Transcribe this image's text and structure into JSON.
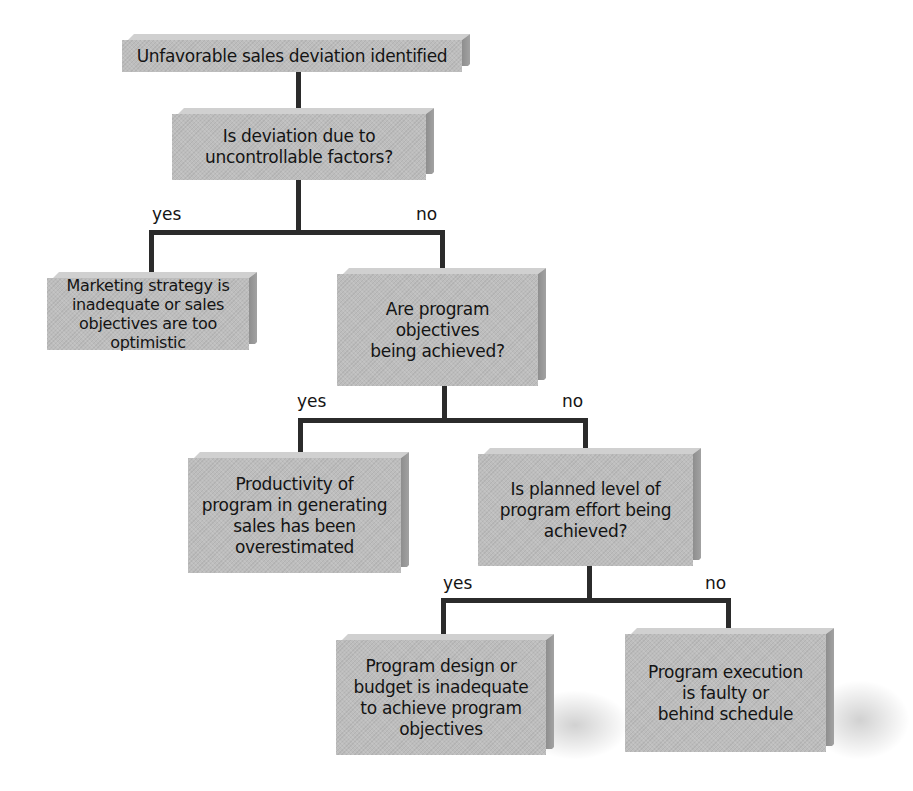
{
  "diagram": {
    "type": "decision-tree",
    "nodes": [
      {
        "id": "start",
        "text": "Unfavorable sales deviation identified"
      },
      {
        "id": "q1",
        "text": "Is deviation due to\nuncontrollable factors?"
      },
      {
        "id": "r1",
        "text": "Marketing strategy is\ninadequate or sales\nobjectives are too\noptimistic"
      },
      {
        "id": "q2",
        "text": "Are program\nobjectives\nbeing achieved?"
      },
      {
        "id": "r2",
        "text": "Productivity of\nprogram in generating\nsales has been\noverestimated"
      },
      {
        "id": "q3",
        "text": "Is planned level of\nprogram effort being\nachieved?"
      },
      {
        "id": "r3",
        "text": "Program design or\nbudget is inadequate\nto achieve program\nobjectives"
      },
      {
        "id": "r4",
        "text": "Program execution\nis faulty or\nbehind schedule"
      }
    ],
    "edges": [
      {
        "from": "start",
        "to": "q1",
        "label": ""
      },
      {
        "from": "q1",
        "to": "r1",
        "label": "yes"
      },
      {
        "from": "q1",
        "to": "q2",
        "label": "no"
      },
      {
        "from": "q2",
        "to": "r2",
        "label": "yes"
      },
      {
        "from": "q2",
        "to": "q3",
        "label": "no"
      },
      {
        "from": "q3",
        "to": "r3",
        "label": "yes"
      },
      {
        "from": "q3",
        "to": "r4",
        "label": "no"
      }
    ],
    "labels": {
      "q1_yes": "yes",
      "q1_no": "no",
      "q2_yes": "yes",
      "q2_no": "no",
      "q3_yes": "yes",
      "q3_no": "no"
    },
    "colors": {
      "box_fill": "#bdbdbd",
      "box_side": "#8e8e8e",
      "connector": "#2b2b2b",
      "text": "#141414"
    }
  }
}
